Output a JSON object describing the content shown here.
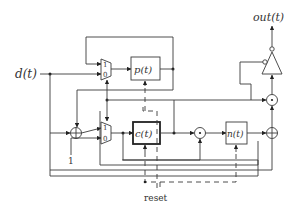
{
  "diagram": {
    "type": "block-diagram",
    "inputs": {
      "d": "d(t)",
      "const_one": "1",
      "reset": "reset"
    },
    "outputs": {
      "out": "out(t)"
    },
    "blocks": {
      "p": "p(t)",
      "c": "c(t)",
      "n": "n(t)"
    },
    "mux_top": {
      "input_1": "1",
      "input_0": "0"
    },
    "mux_bottom": {
      "input_1": "1",
      "input_0": "0"
    },
    "operators": {
      "adder_left": "⊕",
      "multiplier_mid": "⊙",
      "adder_right": "⊕",
      "multiplier_right": "⊙"
    },
    "colors": {
      "line": "#3a3a3a",
      "background": "#ffffff"
    }
  }
}
